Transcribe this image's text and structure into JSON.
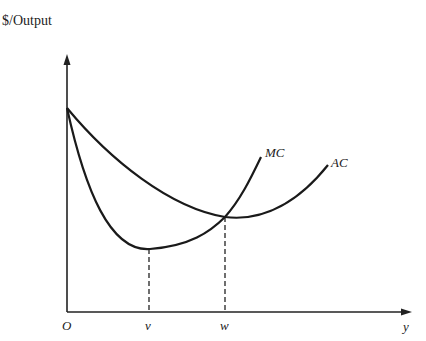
{
  "diagram": {
    "type": "cost-curves",
    "y_axis_label": "$/Output",
    "x_axis_label": "y",
    "origin_label": "O",
    "x_ticks": [
      {
        "label": "v",
        "meaning": "output at MC minimum"
      },
      {
        "label": "w",
        "meaning": "output at AC minimum (MC = AC)"
      }
    ],
    "curves": [
      {
        "name": "MC",
        "label": "MC",
        "description": "marginal cost, U-shaped, min at v, crosses AC at its minimum w"
      },
      {
        "name": "AC",
        "label": "AC",
        "description": "average cost, U-shaped, min at w"
      }
    ],
    "line_color": "#1a1a1a"
  }
}
